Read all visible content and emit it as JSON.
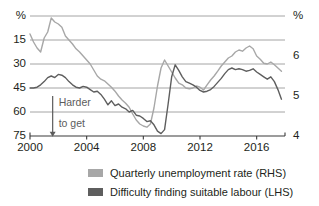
{
  "chart_data": {
    "type": "line",
    "title": "",
    "xlabel": "",
    "ylabel_left": "%",
    "ylabel_right": "%",
    "x_ticks": [
      "2000",
      "2004",
      "2008",
      "2012",
      "2016"
    ],
    "x_tick_values": [
      2000,
      2004,
      2008,
      2012,
      2016
    ],
    "xlim": [
      2000,
      2018
    ],
    "left_axis": {
      "label": "%",
      "ticks": [
        "%",
        "15",
        "30",
        "45",
        "60",
        "75"
      ],
      "tick_values": [
        0,
        15,
        30,
        45,
        60,
        75
      ],
      "ylim": [
        75,
        0
      ],
      "inverted": true,
      "note": "Difficulty finding suitable labour (LHS), axis inverted so down = harder to get"
    },
    "right_axis": {
      "label": "%",
      "ticks": [
        "%",
        "6",
        "5",
        "4"
      ],
      "tick_values": [
        7,
        6,
        5,
        4
      ],
      "ylim": [
        4,
        7
      ],
      "inverted": false,
      "note": "Quarterly unemployment rate (RHS)"
    },
    "grid": true,
    "legend_position": "bottom",
    "annotations": [
      {
        "text_line1": "Harder",
        "text_line2": "to get",
        "arrow": "down-arrow",
        "x": 2001.6,
        "y_left": 58
      }
    ],
    "series": [
      {
        "name": "Quarterly unemployment rate (RHS)",
        "axis": "right",
        "color": "#a7a7a7",
        "x": [
          2000.0,
          2000.25,
          2000.5,
          2000.75,
          2001.0,
          2001.25,
          2001.5,
          2001.75,
          2002.0,
          2002.25,
          2002.5,
          2002.75,
          2003.0,
          2003.25,
          2003.5,
          2003.75,
          2004.0,
          2004.25,
          2004.5,
          2004.75,
          2005.0,
          2005.25,
          2005.5,
          2005.75,
          2006.0,
          2006.25,
          2006.5,
          2006.75,
          2007.0,
          2007.25,
          2007.5,
          2007.75,
          2008.0,
          2008.25,
          2008.5,
          2008.75,
          2009.0,
          2009.25,
          2009.5,
          2009.75,
          2010.0,
          2010.25,
          2010.5,
          2010.75,
          2011.0,
          2011.25,
          2011.5,
          2011.75,
          2012.0,
          2012.25,
          2012.5,
          2012.75,
          2013.0,
          2013.25,
          2013.5,
          2013.75,
          2014.0,
          2014.25,
          2014.5,
          2014.75,
          2015.0,
          2015.25,
          2015.5,
          2015.75,
          2016.0,
          2016.25,
          2016.5,
          2016.75,
          2017.0,
          2017.25,
          2017.5,
          2017.75
        ],
        "values": [
          6.55,
          6.35,
          6.2,
          6.1,
          6.45,
          6.6,
          6.95,
          6.85,
          6.8,
          6.72,
          6.5,
          6.4,
          6.3,
          6.18,
          6.1,
          6.0,
          5.9,
          5.8,
          5.65,
          5.5,
          5.42,
          5.38,
          5.3,
          5.22,
          5.12,
          5.0,
          4.9,
          4.82,
          4.72,
          4.55,
          4.4,
          4.3,
          4.25,
          4.22,
          4.3,
          4.7,
          5.25,
          5.7,
          5.9,
          5.75,
          5.6,
          5.45,
          5.32,
          5.28,
          5.2,
          5.18,
          5.2,
          5.25,
          5.22,
          5.15,
          5.28,
          5.4,
          5.5,
          5.62,
          5.75,
          5.85,
          5.95,
          6.0,
          6.1,
          6.15,
          6.12,
          6.2,
          6.25,
          6.18,
          6.0,
          5.92,
          5.82,
          5.8,
          5.85,
          5.78,
          5.7,
          5.62
        ]
      },
      {
        "name": "Difficulty finding suitable labour (LHS)",
        "axis": "left",
        "color": "#5e5e5e",
        "x": [
          2000.0,
          2000.25,
          2000.5,
          2000.75,
          2001.0,
          2001.25,
          2001.5,
          2001.75,
          2002.0,
          2002.25,
          2002.5,
          2002.75,
          2003.0,
          2003.25,
          2003.5,
          2003.75,
          2004.0,
          2004.25,
          2004.5,
          2004.75,
          2005.0,
          2005.25,
          2005.5,
          2005.75,
          2006.0,
          2006.25,
          2006.5,
          2006.75,
          2007.0,
          2007.25,
          2007.5,
          2007.75,
          2008.0,
          2008.25,
          2008.5,
          2008.75,
          2009.0,
          2009.25,
          2009.5,
          2009.75,
          2010.0,
          2010.25,
          2010.5,
          2010.75,
          2011.0,
          2011.25,
          2011.5,
          2011.75,
          2012.0,
          2012.25,
          2012.5,
          2012.75,
          2013.0,
          2013.25,
          2013.5,
          2013.75,
          2014.0,
          2014.25,
          2014.5,
          2014.75,
          2015.0,
          2015.25,
          2015.5,
          2015.75,
          2016.0,
          2016.25,
          2016.5,
          2016.75,
          2017.0,
          2017.25,
          2017.5,
          2017.75
        ],
        "values": [
          45.0,
          45.0,
          44.5,
          43.0,
          41.0,
          38.5,
          37.5,
          38.5,
          36.5,
          37.0,
          38.5,
          41.0,
          43.0,
          44.5,
          45.0,
          44.0,
          44.5,
          46.0,
          47.5,
          47.0,
          49.0,
          52.0,
          55.5,
          53.0,
          56.0,
          55.0,
          57.0,
          58.0,
          60.0,
          59.0,
          62.0,
          62.5,
          64.0,
          66.0,
          65.5,
          68.0,
          72.0,
          73.5,
          71.0,
          55.0,
          38.0,
          30.5,
          34.0,
          38.0,
          41.0,
          42.0,
          43.0,
          44.5,
          46.5,
          47.5,
          47.0,
          46.0,
          44.0,
          41.5,
          39.0,
          36.0,
          33.5,
          32.5,
          33.5,
          33.0,
          33.5,
          34.5,
          34.0,
          33.0,
          35.0,
          36.5,
          38.0,
          39.5,
          38.0,
          41.0,
          46.0,
          52.0
        ]
      }
    ],
    "legend": [
      {
        "label": "Quarterly unemployment rate (RHS)",
        "color": "#a7a7a7"
      },
      {
        "label": "Difficulty finding suitable labour (LHS)",
        "color": "#5e5e5e"
      }
    ],
    "colors": {
      "grid": "#9a9a9a",
      "axis": "#3a3a3a",
      "background": "#ffffff",
      "light_series": "#a7a7a7",
      "dark_series": "#5e5e5e",
      "annotation": "#5c5c5c"
    }
  }
}
